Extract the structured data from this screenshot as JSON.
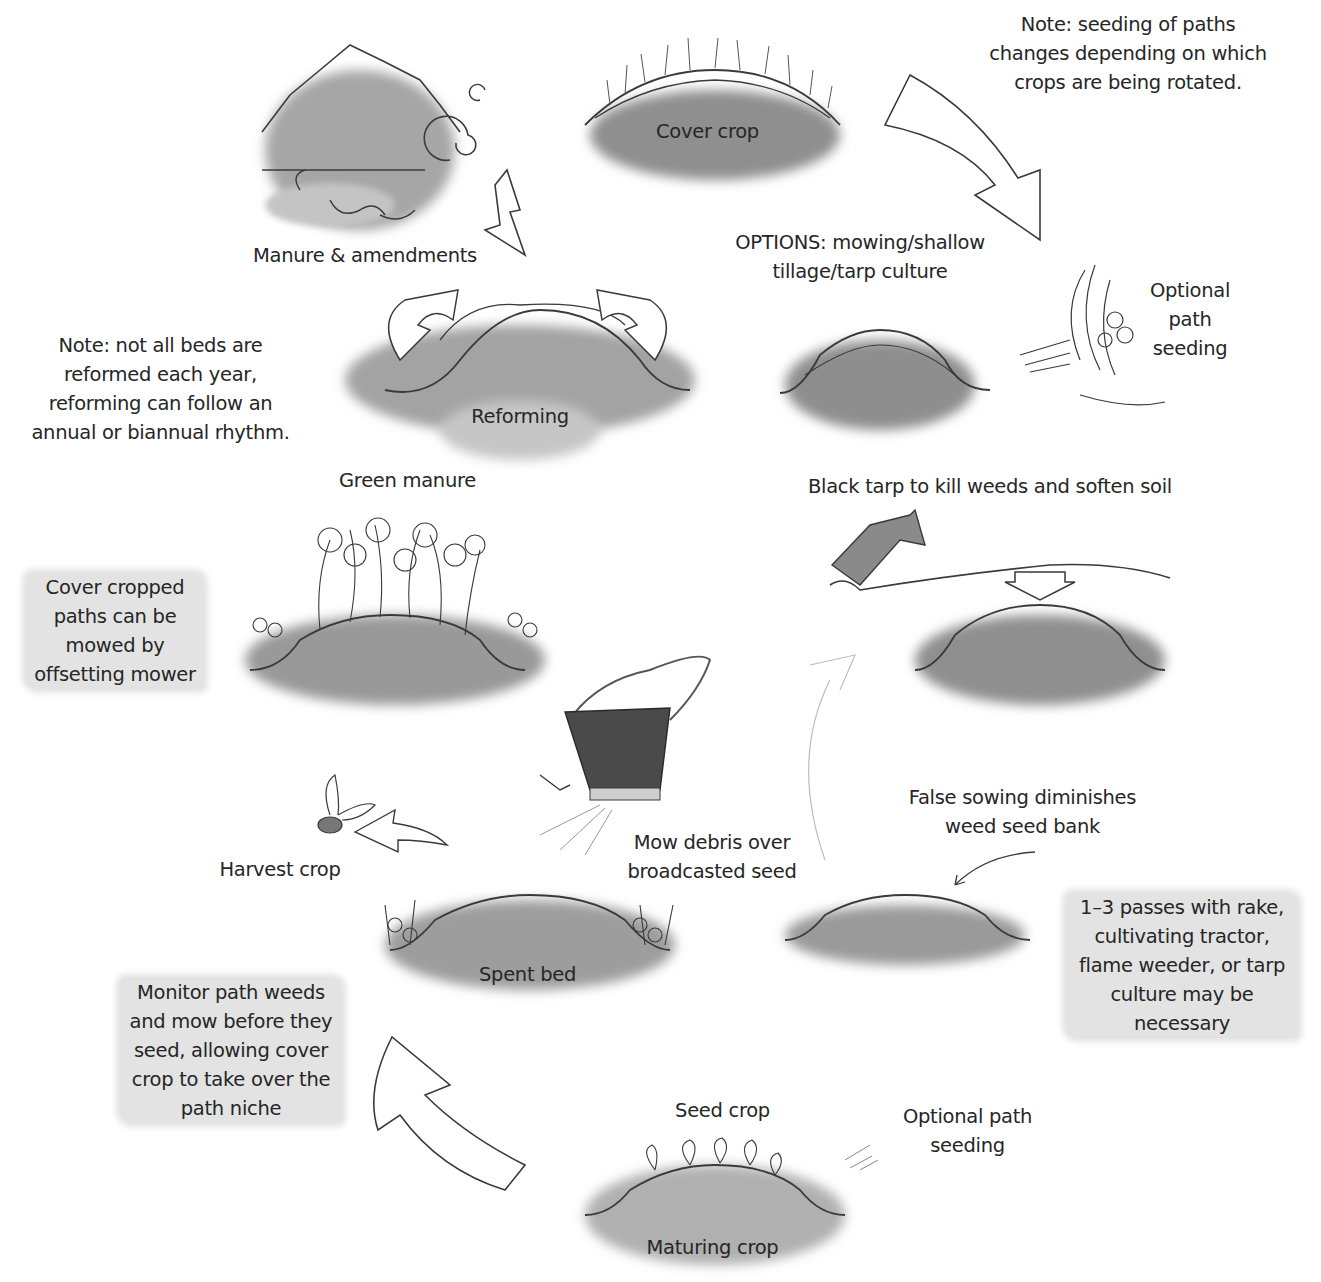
{
  "diagram": {
    "type": "cycle",
    "stages": [
      {
        "id": "cover-crop",
        "label": "Cover crop"
      },
      {
        "id": "options",
        "lines": [
          "OPTIONS: mowing/shallow",
          "tillage/tarp culture"
        ]
      },
      {
        "id": "black-tarp",
        "label": "Black tarp to kill weeds and soften soil"
      },
      {
        "id": "false-sowing",
        "lines": [
          "False sowing diminishes",
          "weed seed bank"
        ]
      },
      {
        "id": "seed-crop",
        "label": "Seed crop"
      },
      {
        "id": "maturing-crop",
        "label": "Maturing crop"
      },
      {
        "id": "spent-bed",
        "label": "Spent bed"
      },
      {
        "id": "harvest-crop",
        "label": "Harvest crop"
      },
      {
        "id": "mow-debris",
        "lines": [
          "Mow debris over",
          "broadcasted seed"
        ]
      },
      {
        "id": "green-manure",
        "label": "Green manure"
      },
      {
        "id": "reforming",
        "label": "Reforming"
      },
      {
        "id": "manure",
        "label": "Manure & amendments"
      }
    ],
    "side_labels": {
      "optional_path_seeding_top": [
        "Optional",
        "path",
        "seeding"
      ],
      "optional_path_seeding_bottom": [
        "Optional path",
        "seeding"
      ]
    },
    "notes": {
      "top_right": [
        "Note: seeding of paths",
        "changes depending on which",
        "crops are being rotated."
      ],
      "left_reform": [
        "Note: not all beds are",
        "reformed each year,",
        "reforming can follow an",
        "annual or biannual rhythm."
      ]
    },
    "callouts": {
      "cover_cropped_paths": [
        "Cover cropped",
        "paths can be",
        "mowed  by",
        "offsetting mower"
      ],
      "passes": [
        "1–3 passes with rake,",
        "cultivating tractor,",
        "flame weeder, or tarp",
        "culture may be",
        "necessary"
      ],
      "monitor": [
        "Monitor path weeds",
        "and mow before they",
        "seed, allowing cover",
        "crop to take over the",
        "path niche"
      ]
    },
    "colors": {
      "ink": "#3a3a3a",
      "soil_wash": "#9a9a9a",
      "callout_bg": "#e3e3e3",
      "background": "#ffffff"
    }
  }
}
